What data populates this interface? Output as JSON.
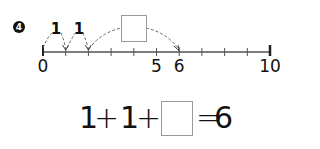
{
  "problem": {
    "number": "4"
  },
  "number_line": {
    "min": 0,
    "max": 10,
    "ticks": [
      0,
      1,
      2,
      3,
      4,
      5,
      6,
      7,
      8,
      9,
      10
    ],
    "labels": [
      {
        "value": 0,
        "text": "0"
      },
      {
        "value": 5,
        "text": "5"
      },
      {
        "value": 6,
        "text": "6"
      },
      {
        "value": 10,
        "text": "10"
      }
    ],
    "jumps": [
      {
        "from": 0,
        "to": 1,
        "label": "1"
      },
      {
        "from": 1,
        "to": 2,
        "label": "1"
      },
      {
        "from": 2,
        "to": 6,
        "label": ""
      }
    ],
    "answer_box_value": ""
  },
  "equation": {
    "term1": "1",
    "op1": "+",
    "term2": "1",
    "op2": "+",
    "blank_value": "",
    "equals": "=",
    "result": "6"
  },
  "colors": {
    "ink": "#111111",
    "dashed": "#666666",
    "box_border": "#9a9a9a"
  }
}
